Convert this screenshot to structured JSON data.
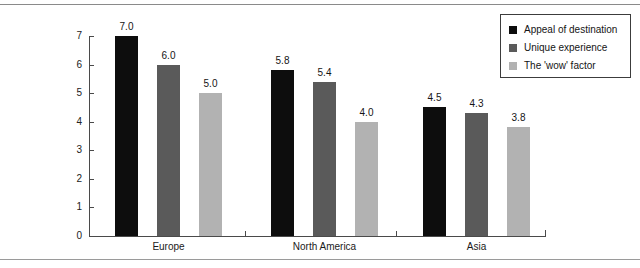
{
  "page": {
    "background": "#ffffff",
    "top_rule_color": "#8a8a8a",
    "bottom_rule_color": "#9a9a9a"
  },
  "chart_data": {
    "type": "bar",
    "title": "",
    "subtitle": "",
    "xlabel": "",
    "ylabel": "",
    "categories": [
      "Europe",
      "North America",
      "Asia"
    ],
    "series": [
      {
        "name": "Appeal of destination",
        "color": "#0d0d0d",
        "values": [
          7.0,
          5.8,
          4.5
        ],
        "labels": [
          "7.0",
          "5.8",
          "4.5"
        ]
      },
      {
        "name": "Unique experience",
        "color": "#5a5a5a",
        "values": [
          6.0,
          5.4,
          4.3
        ],
        "labels": [
          "6.0",
          "5.4",
          "4.3"
        ]
      },
      {
        "name": "The 'wow' factor",
        "color": "#b2b2b2",
        "values": [
          5.0,
          4.0,
          3.8
        ],
        "labels": [
          "5.0",
          "4.0",
          "3.8"
        ]
      }
    ],
    "ylim": [
      0,
      7
    ],
    "yticks": [
      0,
      1,
      2,
      3,
      4,
      5,
      6,
      7
    ],
    "ytick_labels": [
      "0",
      "1",
      "2",
      "3",
      "4",
      "5",
      "6",
      "7"
    ],
    "grid": false,
    "legend_position": "top-right",
    "value_labels_shown": true
  },
  "axis": {
    "y_tick_labels": [
      "7",
      "6",
      "5",
      "4",
      "3",
      "2",
      "1",
      "0"
    ],
    "x_category_labels": [
      "Europe",
      "North America",
      "Asia"
    ]
  },
  "legend": {
    "items": [
      {
        "label": "Appeal of destination",
        "color": "#0d0d0d"
      },
      {
        "label": "Unique experience",
        "color": "#5a5a5a"
      },
      {
        "label": "The 'wow' factor",
        "color": "#b2b2b2"
      }
    ]
  }
}
